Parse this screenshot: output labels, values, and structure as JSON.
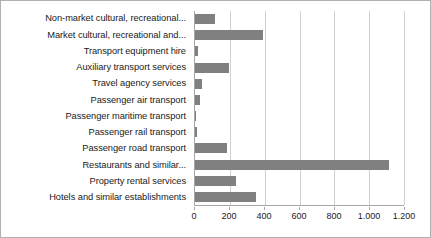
{
  "chart_data": {
    "type": "bar",
    "orientation": "horizontal",
    "title": "",
    "xlabel": "",
    "ylabel": "",
    "xlim": [
      0,
      1200
    ],
    "grid": true,
    "legend": false,
    "bar_color": "#808080",
    "tick_labels": [
      "0",
      "200",
      "400",
      "600",
      "800",
      "1.000",
      "1.200"
    ],
    "ticks": [
      0,
      200,
      400,
      600,
      800,
      1000,
      1200
    ],
    "categories": [
      "Non-market cultural, recreational...",
      "Market cultural, recreational and...",
      "Transport equipment hire",
      "Auxiliary transport services",
      "Travel agency services",
      "Passenger air transport",
      "Passenger maritime transport",
      "Passenger rail transport",
      "Passenger road transport",
      "Restaurants and similar...",
      "Property rental services",
      "Hotels and similar establishments"
    ],
    "values": [
      115,
      390,
      20,
      195,
      40,
      28,
      5,
      12,
      185,
      1115,
      235,
      350
    ]
  }
}
